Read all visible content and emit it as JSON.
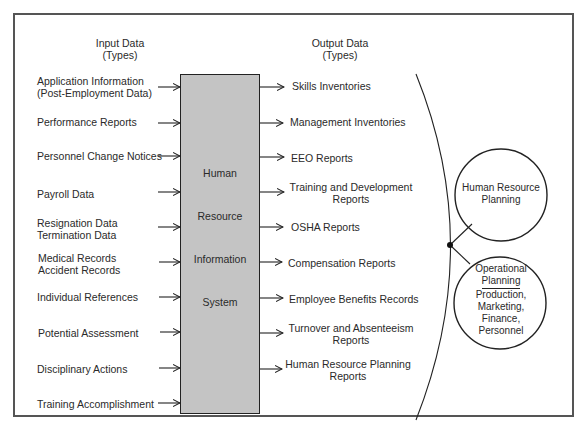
{
  "input_header": {
    "line1": "Input Data",
    "line2": "(Types)"
  },
  "output_header": {
    "line1": "Output Data",
    "line2": "(Types)"
  },
  "inputs": [
    {
      "line1": "Application Information",
      "line2": "(Post-Employment Data)"
    },
    {
      "line1": "Performance Reports"
    },
    {
      "line1": "Personnel Change Notices"
    },
    {
      "line1": "Payroll Data"
    },
    {
      "line1": "Resignation Data",
      "line2": "Termination Data"
    },
    {
      "line1": "Medical Records",
      "line2": "Accident Records"
    },
    {
      "line1": "Individual References"
    },
    {
      "line1": "Potential Assessment"
    },
    {
      "line1": "Disciplinary Actions"
    },
    {
      "line1": "Training Accomplishment"
    }
  ],
  "system": {
    "words": [
      "Human",
      "Resource",
      "Information",
      "System"
    ]
  },
  "outputs": [
    {
      "line1": "Skills Inventories"
    },
    {
      "line1": "Management Inventories"
    },
    {
      "line1": "EEO Reports"
    },
    {
      "line1": "Training and Development",
      "line2": "Reports"
    },
    {
      "line1": "OSHA Reports"
    },
    {
      "line1": "Compensation Reports"
    },
    {
      "line1": "Employee Benefits Records"
    },
    {
      "line1": "Turnover and Absenteeism",
      "line2": "Reports"
    },
    {
      "line1": "Human Resource Planning",
      "line2": "Reports"
    }
  ],
  "planning": {
    "hr_planning": {
      "line1": "Human Resource",
      "line2": "Planning"
    },
    "operational": {
      "title1": "Operational",
      "title2": "Planning",
      "areas": [
        "Production,",
        "Marketing,",
        "Finance,",
        "Personnel"
      ]
    }
  },
  "colors": {
    "box_fill": "#c4c4c4",
    "line": "#222222",
    "frame": "#555555"
  }
}
